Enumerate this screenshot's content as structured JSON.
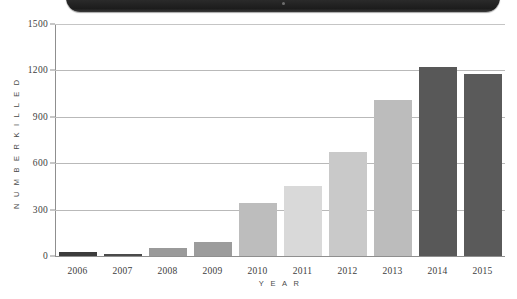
{
  "device": {
    "bezel_name": "tablet-bezel-strip",
    "bezel_color": "#262626",
    "camera_dot_color": "#6e6e6e"
  },
  "chart_data": {
    "type": "bar",
    "title": "",
    "subtitle": "",
    "xlabel": "Y E A R",
    "ylabel": "N U M B E R   K I L L E D",
    "categories": [
      "2006",
      "2007",
      "2008",
      "2009",
      "2010",
      "2011",
      "2012",
      "2013",
      "2014",
      "2015"
    ],
    "values": [
      25,
      12,
      55,
      90,
      340,
      450,
      670,
      1010,
      1220,
      1180
    ],
    "bar_colors": [
      "#3c3c3c",
      "#4a4a4a",
      "#9a9a9a",
      "#9c9c9c",
      "#bdbdbd",
      "#d9d9d9",
      "#c9c9c9",
      "#bcbcbc",
      "#585858",
      "#5a5a5a"
    ],
    "ylim": [
      0,
      1500
    ],
    "yticks": [
      0,
      300,
      600,
      900,
      1200,
      1500
    ],
    "ytick_labels": [
      "0",
      "300",
      "600",
      "900",
      "1200",
      "1500"
    ],
    "grid": true,
    "grid_color": "#b9b9b9",
    "axis_color": "#8f8f8f",
    "legend": null,
    "legend_position": "none",
    "annotations": []
  }
}
